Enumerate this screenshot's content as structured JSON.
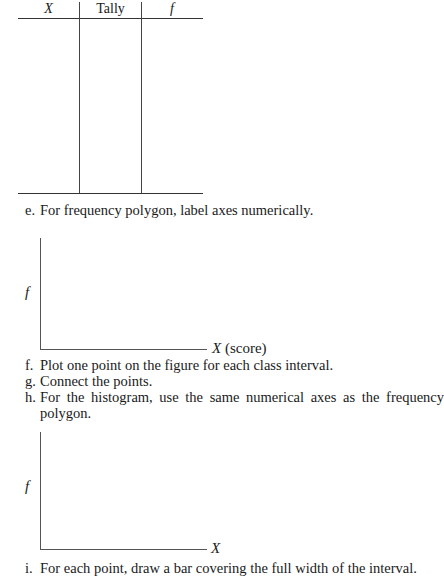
{
  "tally_table": {
    "headers": [
      "X",
      "Tally",
      "f"
    ],
    "rows": []
  },
  "steps": [
    {
      "letter": "e.",
      "text": "For frequency polygon, label axes numerically."
    },
    {
      "letter": "f.",
      "text": "Plot one point on the figure for each class interval."
    },
    {
      "letter": "g.",
      "text": "Connect the points."
    },
    {
      "letter": "h.",
      "text": "For the histogram, use the same numerical axes as the frequency"
    },
    {
      "letter": "",
      "text": "polygon."
    },
    {
      "letter": "i.",
      "text": "For each point, draw a bar covering the full width of the interval."
    }
  ],
  "polygon_axes": {
    "y_label": "f",
    "x_label_var": "X",
    "x_label_suffix": " (score)"
  },
  "histogram_axes": {
    "y_label": "f",
    "x_label": "X"
  }
}
